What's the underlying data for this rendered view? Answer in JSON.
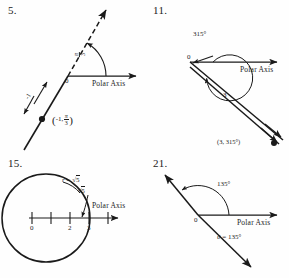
{
  "figure": {
    "common_axis_label": "Polar Axis",
    "origin_label": "0"
  },
  "panels": [
    {
      "number": "5.",
      "id": "panel-5",
      "axis_label": "Polar Axis",
      "origin_label": "0",
      "angle_label_numerator": "π",
      "angle_label_denominator": "3",
      "radius_label": "-1",
      "point_label_open": "(",
      "point_label_r": "-1,",
      "point_label_theta_num": "π",
      "point_label_theta_den": "3",
      "point_label_close": ")",
      "angle_degrees": 60,
      "description": "Dashed terminal ray at pi/3 with solid opposite ray; point (-1, pi/3)"
    },
    {
      "number": "11.",
      "id": "panel-11",
      "axis_label": "Polar Axis",
      "origin_label": "0",
      "angle_label": "315°",
      "radius_label": "3",
      "point_label": "(3, 315°)",
      "angle_degrees": 315,
      "radius_value": 3,
      "description": "315 degree counterclockwise arc with ray to point (3, 315 degrees)"
    },
    {
      "number": "15.",
      "id": "panel-15",
      "axis_label": "Polar Axis",
      "equation_lhs": "r",
      "equation_eq": "=",
      "equation_radical": "√",
      "equation_radicand": "5",
      "callout_radical": "√",
      "callout_radicand": "5",
      "tick_labels": [
        "0",
        "2",
        "3"
      ],
      "tick_positions": [
        0,
        1,
        2,
        3
      ],
      "radius_value": "√5",
      "description": "Circle of radius sqrt(5) centered at pole with number line"
    },
    {
      "number": "21.",
      "id": "panel-21",
      "axis_label": "Polar Axis",
      "origin_label": "0",
      "angle_label": "135°",
      "equation_label_theta": "θ",
      "equation_label_eq": "=",
      "equation_label_value": "135°",
      "angle_degrees": 135,
      "description": "Full line through pole at 135 degrees"
    }
  ],
  "colors": {
    "ink": "#1a1a1a",
    "paper": "#fefefe"
  }
}
